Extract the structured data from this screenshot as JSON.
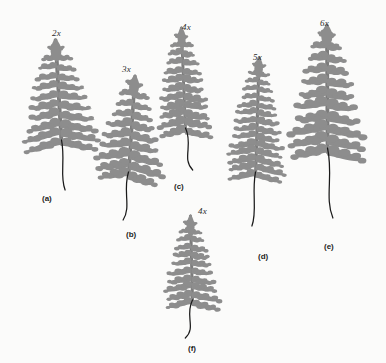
{
  "figure": {
    "background_color": "#fbfbfa",
    "frond_color": "#8d8d8d",
    "frond_color_dark": "#7c7c7c",
    "stipe_color": "#1a1a1a",
    "specimen_count": 6
  },
  "specimens": [
    {
      "id": "a",
      "letter_label": "(a)",
      "magnification_label": "2x",
      "x": 18,
      "y": 36,
      "width": 86,
      "height": 150,
      "mag_x": 52,
      "mag_y": 28,
      "letter_x": 42,
      "letter_y": 194,
      "outline_width": 78,
      "blade_height": 104,
      "stipe_length": 46,
      "pinna_pairs": 11,
      "shape": "broad-lanceolate",
      "tilt_deg": -3
    },
    {
      "id": "b",
      "letter_label": "(b)",
      "magnification_label": "3x",
      "x": 88,
      "y": 72,
      "width": 80,
      "height": 150,
      "mag_x": 122,
      "mag_y": 64,
      "letter_x": 126,
      "letter_y": 230,
      "outline_width": 72,
      "blade_height": 100,
      "stipe_length": 44,
      "pinna_pairs": 10,
      "shape": "ovate-lanceolate",
      "tilt_deg": 4
    },
    {
      "id": "c",
      "letter_label": "(c)",
      "magnification_label": "4x",
      "x": 152,
      "y": 24,
      "width": 66,
      "height": 146,
      "mag_x": 182,
      "mag_y": 22,
      "letter_x": 174,
      "letter_y": 182,
      "outline_width": 58,
      "blade_height": 104,
      "stipe_length": 38,
      "pinna_pairs": 12,
      "shape": "narrow-lanceolate",
      "tilt_deg": -2
    },
    {
      "id": "d",
      "letter_label": "(d)",
      "magnification_label": "5x",
      "x": 220,
      "y": 54,
      "width": 70,
      "height": 176,
      "mag_x": 253,
      "mag_y": 52,
      "letter_x": 258,
      "letter_y": 252,
      "outline_width": 62,
      "blade_height": 118,
      "stipe_length": 50,
      "pinna_pairs": 15,
      "shape": "linear-lanceolate",
      "tilt_deg": 2
    },
    {
      "id": "e",
      "letter_label": "(e)",
      "magnification_label": "6x",
      "x": 284,
      "y": 22,
      "width": 86,
      "height": 196,
      "mag_x": 320,
      "mag_y": 18,
      "letter_x": 324,
      "letter_y": 242,
      "outline_width": 80,
      "blade_height": 126,
      "stipe_length": 66,
      "pinna_pairs": 11,
      "shape": "broad-ovate",
      "tilt_deg": 0
    },
    {
      "id": "f",
      "letter_label": "(f)",
      "magnification_label": "4x",
      "x": 158,
      "y": 212,
      "width": 68,
      "height": 126,
      "mag_x": 198,
      "mag_y": 206,
      "letter_x": 188,
      "letter_y": 344,
      "outline_width": 58,
      "blade_height": 88,
      "stipe_length": 34,
      "pinna_pairs": 11,
      "shape": "narrow-lanceolate",
      "tilt_deg": -1
    }
  ]
}
